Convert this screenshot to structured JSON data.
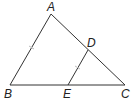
{
  "diagram": {
    "type": "geometry-triangle",
    "points": {
      "A": {
        "label": "A",
        "x": 51,
        "y": 14
      },
      "B": {
        "label": "B",
        "x": 10,
        "y": 85
      },
      "C": {
        "label": "C",
        "x": 125,
        "y": 85
      },
      "D": {
        "label": "D",
        "x": 88,
        "y": 50
      },
      "E": {
        "label": "E",
        "x": 68,
        "y": 85
      }
    },
    "segments": [
      "AB",
      "BC",
      "CA",
      "DE"
    ],
    "tick_marks": [
      "AB",
      "DE"
    ],
    "line_color": "#333333"
  }
}
